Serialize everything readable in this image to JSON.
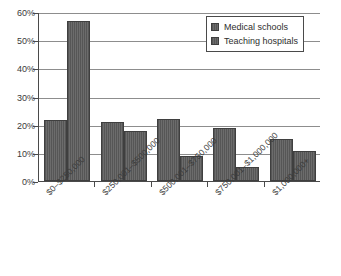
{
  "chart_data": {
    "type": "bar",
    "title": "",
    "subtitle": "",
    "xlabel": "",
    "ylabel": "",
    "grid": true,
    "legend_position": "top-right",
    "ylim": [
      0,
      60
    ],
    "ytick_step": 10,
    "ytick_labels": [
      "0%",
      "10%",
      "20%",
      "30%",
      "40%",
      "50%",
      "60%"
    ],
    "ytick_values": [
      0,
      10,
      20,
      30,
      40,
      50,
      60
    ],
    "value_unit": "%",
    "categories": [
      "$0–$250,000",
      "$250,001–$500,000",
      "$500,001–$750,000",
      "$750,001–$1,000,000",
      "$1,000,000+"
    ],
    "series": [
      {
        "name": "Medical schools",
        "color": "#565656",
        "values": [
          21.7,
          20.8,
          21.9,
          18.8,
          14.9
        ]
      },
      {
        "name": "Teaching hospitals",
        "color": "#565656",
        "values": [
          56.9,
          17.8,
          8.9,
          5.0,
          10.7
        ]
      }
    ]
  },
  "legend": {
    "items": [
      {
        "label": "Medical schools"
      },
      {
        "label": "Teaching hospitals"
      }
    ]
  }
}
